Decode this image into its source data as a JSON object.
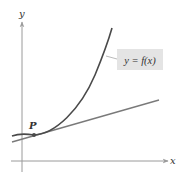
{
  "diagram": {
    "axes": {
      "x_label": "x",
      "y_label": "y"
    },
    "curve_label": "y = f(x)",
    "point_label": "P",
    "colors": {
      "axis": "#9a9a9a",
      "curve": "#4a4a4a",
      "tangent": "#7a7a7a",
      "label_box": "#e4e4e4",
      "point": "#4a4a4a"
    }
  }
}
